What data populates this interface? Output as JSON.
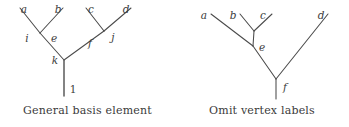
{
  "figure": {
    "background_color": "#ffffff",
    "line_color": "#4a4a4a",
    "text_color": "#3a3a3a",
    "width": 349,
    "height": 127
  },
  "panels": [
    {
      "id": "general-basis-element",
      "caption": "General basis element",
      "type": "trivalent-tree",
      "leaf_labels": [
        "a",
        "b",
        "c",
        "d"
      ],
      "internal_labels": [
        "i",
        "e",
        "j",
        "f",
        "k"
      ],
      "root_label": "1",
      "labels": {
        "a": "a",
        "b": "b",
        "c": "c",
        "d": "d",
        "i": "i",
        "e": "e",
        "j": "j",
        "f": "f",
        "k": "k",
        "root": "1"
      }
    },
    {
      "id": "omit-vertex-labels",
      "caption": "Omit vertex labels",
      "type": "trivalent-tree",
      "leaf_labels": [
        "a",
        "b",
        "c",
        "d"
      ],
      "internal_labels": [
        "e",
        "f"
      ],
      "root_label": "",
      "labels": {
        "a": "a",
        "b": "b",
        "c": "c",
        "d": "d",
        "e": "e",
        "f": "f"
      }
    }
  ]
}
